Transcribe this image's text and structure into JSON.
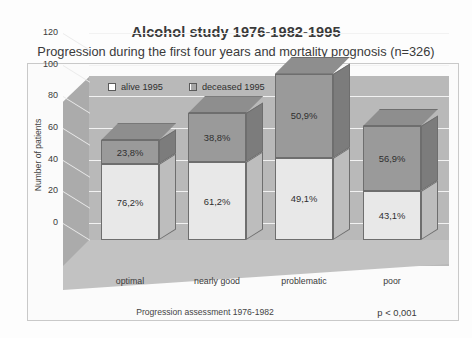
{
  "title": "Alcohol study 1976-1982-1995",
  "subtitle": "Progression during the first four years and mortality prognosis (n=326)",
  "annotation": "p < 0,001",
  "legend": {
    "alive_label": "alive 1995",
    "deceased_label": "deceased 1995"
  },
  "axes": {
    "ylabel": "Number of patients",
    "xlabel": "Progression assessment 1976-1982",
    "yticks": [
      "0",
      "20",
      "40",
      "60",
      "80",
      "100",
      "120"
    ]
  },
  "colors": {
    "alive": "#e8e8e8",
    "deceased": "#9a9a9a",
    "backwall": "#b9b9b9",
    "gridline": "#f2f2f2",
    "outline": "#6e6e6e"
  },
  "chart_data": {
    "type": "bar",
    "subtype": "stacked-3d",
    "title": "Alcohol study 1976-1982-1995",
    "subtitle": "Progression during the first four years and mortality prognosis (n=326)",
    "xlabel": "Progression assessment 1976-1982",
    "ylabel": "Number of patients",
    "ylim": [
      0,
      120
    ],
    "ytick_step": 20,
    "grid": true,
    "legend_position": "inside-top-left",
    "annotation": "p < 0,001",
    "categories": [
      "optimal",
      "nearly good",
      "problematic",
      "poor"
    ],
    "totals": [
      63,
      80,
      105,
      72
    ],
    "series": [
      {
        "name": "alive 1995",
        "values": [
          48,
          49,
          52,
          31
        ],
        "percent_labels": [
          "76,2%",
          "61,2%",
          "49,1%",
          "43,1%"
        ],
        "percents": [
          76.2,
          61.2,
          49.1,
          43.1
        ],
        "color": "#e8e8e8"
      },
      {
        "name": "deceased 1995",
        "values": [
          15,
          31,
          53,
          41
        ],
        "percent_labels": [
          "23,8%",
          "38,8%",
          "50,9%",
          "56,9%"
        ],
        "percents": [
          23.8,
          38.8,
          50.9,
          56.9
        ],
        "color": "#9a9a9a"
      }
    ]
  }
}
